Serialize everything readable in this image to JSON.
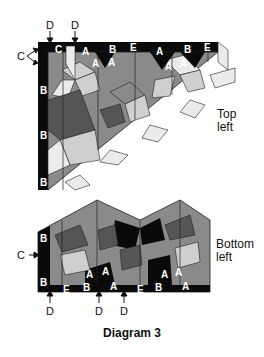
{
  "caption": "Diagram 3",
  "colors": {
    "black": "#0a0a0a",
    "dark": "#555555",
    "mid": "#8a8a8a",
    "light": "#cfcfcf",
    "pale": "#ebebeb",
    "outline": "#222222"
  },
  "top_section": {
    "label_line1": "Top",
    "label_line2": "left",
    "callouts": {
      "d1": "D",
      "d2": "D",
      "c": "C"
    },
    "piece_labels": [
      "C",
      "A",
      "B",
      "E",
      "A",
      "B",
      "E",
      "A",
      "A",
      "A",
      "A",
      "B",
      "B",
      "B"
    ]
  },
  "bottom_section": {
    "label_line1": "Bottom",
    "label_line2": "left",
    "callouts": {
      "c": "C",
      "d1": "D",
      "d2": "D",
      "d3": "D"
    },
    "piece_labels": [
      "B",
      "B",
      "E",
      "A",
      "A",
      "B",
      "A",
      "E",
      "A",
      "A",
      "B",
      "A"
    ]
  }
}
